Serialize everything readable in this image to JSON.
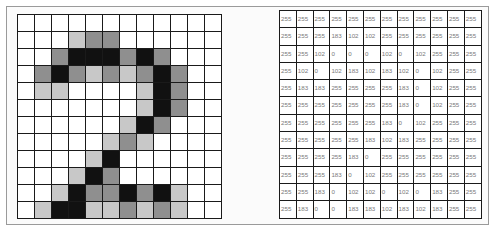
{
  "figure": {
    "grid_size": {
      "rows": 12,
      "cols": 12
    },
    "color_map": {
      "0": "#111111",
      "102": "#8f8f8f",
      "183": "#c8c8c8",
      "255": "#ffffff"
    },
    "pixel_values": [
      [
        255,
        255,
        255,
        255,
        255,
        255,
        255,
        255,
        255,
        255,
        255,
        255
      ],
      [
        255,
        255,
        255,
        183,
        102,
        102,
        255,
        255,
        255,
        255,
        255,
        255
      ],
      [
        255,
        255,
        102,
        0,
        0,
        0,
        102,
        0,
        102,
        255,
        255,
        255
      ],
      [
        255,
        102,
        0,
        102,
        183,
        102,
        183,
        102,
        0,
        102,
        255,
        255
      ],
      [
        255,
        183,
        183,
        255,
        255,
        255,
        255,
        183,
        0,
        102,
        255,
        255
      ],
      [
        255,
        255,
        255,
        255,
        255,
        255,
        255,
        183,
        0,
        102,
        255,
        255
      ],
      [
        255,
        255,
        255,
        255,
        255,
        255,
        183,
        0,
        102,
        255,
        255,
        255
      ],
      [
        255,
        255,
        255,
        255,
        255,
        183,
        102,
        183,
        255,
        255,
        255,
        255
      ],
      [
        255,
        255,
        255,
        255,
        183,
        0,
        255,
        255,
        255,
        255,
        255,
        255
      ],
      [
        255,
        255,
        255,
        183,
        0,
        102,
        255,
        255,
        255,
        255,
        255,
        255
      ],
      [
        255,
        255,
        183,
        0,
        102,
        102,
        0,
        102,
        0,
        183,
        255,
        255
      ],
      [
        255,
        183,
        0,
        0,
        183,
        183,
        102,
        183,
        102,
        183,
        255,
        255
      ]
    ]
  }
}
